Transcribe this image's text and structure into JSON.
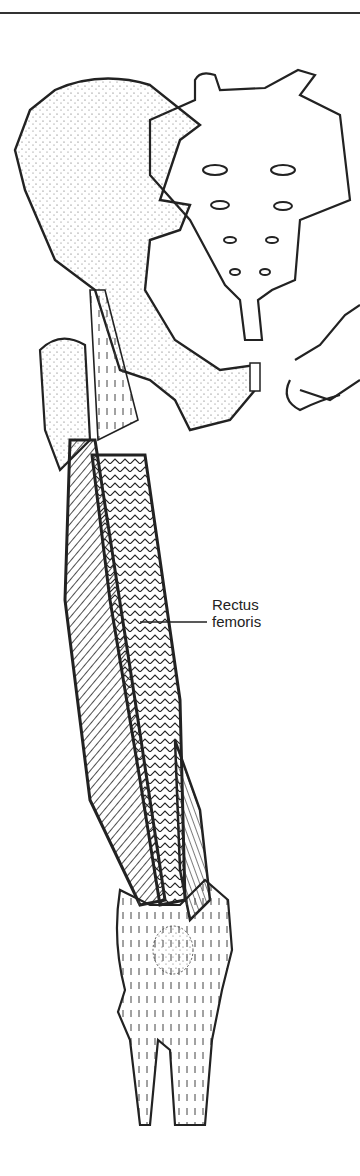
{
  "figure": {
    "labels": [
      {
        "text_line1": "Rectus",
        "text_line2": "femoris",
        "points_to": "rectus-femoris-muscle"
      }
    ]
  },
  "colors": {
    "ink": "#222222",
    "background": "#ffffff",
    "stipple": "#555555"
  }
}
